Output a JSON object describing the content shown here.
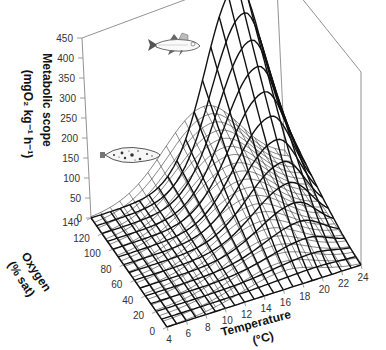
{
  "chart_data": {
    "type": "surface3d",
    "title": "",
    "xlabel": "Temperature",
    "xlabel_unit": "(°C)",
    "ylabel": "Oxygen",
    "ylabel_unit": "(% sat)",
    "zlabel": "Metabolic scope",
    "zlabel_unit": "(mgO₂ kg⁻¹ h⁻¹)",
    "x_ticks": [
      4,
      6,
      8,
      10,
      12,
      14,
      16,
      18,
      20,
      22,
      24
    ],
    "y_ticks": [
      0,
      20,
      40,
      60,
      80,
      100,
      120,
      140
    ],
    "z_ticks": [
      0,
      50,
      100,
      150,
      200,
      250,
      300,
      350,
      400,
      450
    ],
    "xlim": [
      4,
      24
    ],
    "ylim": [
      0,
      140
    ],
    "zlim": [
      0,
      450
    ],
    "series": [
      {
        "name": "Pikeperch (upper fish)",
        "style": "thick",
        "peak_temperature": 20,
        "peak_value": 440,
        "description": "Tall surface peaking near 20°C at high oxygen; scope increases with oxygen saturation"
      },
      {
        "name": "Flatfish (lower fish)",
        "style": "thin",
        "peak_temperature": 16,
        "peak_value": 180,
        "description": "Low broad surface peaking near 15-16°C; scope increases with oxygen saturation"
      }
    ]
  },
  "labels": {
    "z_title_line1": "Metabolic scope",
    "z_title_line2": "(mgO₂ kg⁻¹ h⁻¹)",
    "y_title_line1": "Oxygen",
    "y_title_line2": "(% sat)",
    "x_title_line1": "Temperature",
    "x_title_line2": "(°C)"
  },
  "icons": {
    "fish_upper": "pikeperch-fish-icon",
    "fish_lower": "flatfish-icon"
  }
}
